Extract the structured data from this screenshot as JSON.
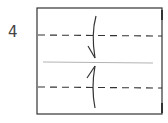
{
  "diagram": {
    "step_number": "4",
    "type": "origami-fold-instruction",
    "paper": {
      "x": 37,
      "y": 8,
      "width": 125,
      "height": 106,
      "stroke": "#333333"
    },
    "fold_lines": [
      {
        "kind": "valley-fold-dashed",
        "y": 35
      },
      {
        "kind": "center-crease",
        "y": 62
      },
      {
        "kind": "valley-fold-dashed",
        "y": 87
      }
    ],
    "arrows": [
      {
        "direction": "down",
        "label": "fold top edge to center"
      },
      {
        "direction": "up",
        "label": "fold bottom edge to center"
      }
    ],
    "colors": {
      "line": "#333333",
      "crease": "#aaaaaa",
      "text": "#444444"
    }
  }
}
